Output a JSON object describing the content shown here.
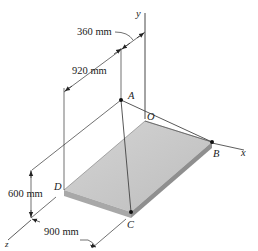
{
  "figure": {
    "type": "3D statics diagram",
    "axes": {
      "x": "x",
      "y": "y",
      "z": "z"
    },
    "points": {
      "A": "A",
      "B": "B",
      "C": "C",
      "D": "D",
      "O": "O"
    },
    "dimensions": {
      "d360": "360 mm",
      "d920": "920 mm",
      "d600": "600 mm",
      "d900": "900 mm"
    },
    "colors": {
      "plate_top": "#c9c9c9",
      "plate_edge": "#9e9e9e",
      "lines": "#333333"
    }
  }
}
